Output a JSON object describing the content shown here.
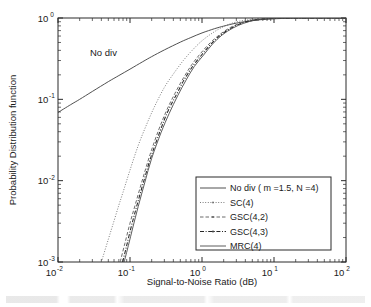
{
  "figure": {
    "title": "",
    "annotation": {
      "text": "No div",
      "x_data": 0.055,
      "y_data": 0.35
    }
  },
  "axes": {
    "x": {
      "label": "Signal-to-Noise Ratio (dB)",
      "scale": "log",
      "min": 0.01,
      "max": 100,
      "tick_labels": [
        "10",
        "10",
        "10",
        "10",
        "10"
      ],
      "tick_exponents": [
        "-2",
        "-1",
        "0",
        "1",
        "2"
      ],
      "tick_values": [
        0.01,
        0.1,
        1,
        10,
        100
      ]
    },
    "y": {
      "label": "Probability Distribution function",
      "scale": "log",
      "min": 0.001,
      "max": 1,
      "tick_labels": [
        "10",
        "10",
        "10",
        "10"
      ],
      "tick_exponents": [
        "0",
        "-1",
        "-2",
        "-3"
      ],
      "tick_values": [
        1,
        0.1,
        0.01,
        0.001
      ]
    }
  },
  "legend": {
    "position": "lower-right",
    "entries": [
      {
        "label": "No div ( m =1.5, N =4)",
        "style": "solid",
        "color": "#3c3c3c",
        "marker": "none"
      },
      {
        "label": "SC(4)",
        "style": "dotted",
        "color": "#6e6e6e",
        "marker": "dot"
      },
      {
        "label": "GSC(4,2)",
        "style": "dashed",
        "color": "#5a5a5a",
        "marker": "dot"
      },
      {
        "label": "GSC(4,3)",
        "style": "dashdot",
        "color": "#262626",
        "marker": "dot"
      },
      {
        "label": "MRC(4)",
        "style": "solid",
        "color": "#4a4a4a",
        "marker": "none"
      }
    ]
  },
  "chart_data": {
    "type": "line",
    "title": "",
    "xlabel": "Signal-to-Noise Ratio (dB)",
    "ylabel": "Probability Distribution function",
    "xscale": "log",
    "yscale": "log",
    "xlim": [
      0.01,
      100
    ],
    "ylim": [
      0.001,
      1
    ],
    "grid": false,
    "legend_position": "lower-right",
    "annotations": [
      {
        "text": "No div",
        "x": 0.055,
        "y": 0.35
      }
    ],
    "series": [
      {
        "name": "No div ( m =1.5, N =4)",
        "style": "solid",
        "color": "#3c3c3c",
        "x": [
          0.01,
          0.015,
          0.02,
          0.03,
          0.05,
          0.07,
          0.1,
          0.15,
          0.2,
          0.3,
          0.5,
          0.7,
          1.0,
          1.5,
          2.0,
          3.0,
          5.0,
          7.0,
          10.0,
          15.0,
          20.0,
          30.0,
          50.0,
          100.0
        ],
        "y": [
          0.069,
          0.086,
          0.1,
          0.125,
          0.165,
          0.196,
          0.235,
          0.29,
          0.335,
          0.405,
          0.505,
          0.575,
          0.655,
          0.74,
          0.795,
          0.865,
          0.93,
          0.958,
          0.978,
          0.991,
          0.996,
          0.999,
          1.0,
          1.0
        ]
      },
      {
        "name": "SC(4)",
        "style": "dotted",
        "color": "#6e6e6e",
        "x": [
          0.04,
          0.05,
          0.06,
          0.07,
          0.08,
          0.1,
          0.13,
          0.17,
          0.22,
          0.3,
          0.4,
          0.55,
          0.75,
          1.0,
          1.4,
          2.0,
          3.0,
          4.5,
          6.0,
          8.0,
          11.0,
          15.0,
          25.0,
          50.0,
          100.0
        ],
        "y": [
          0.001,
          0.0019,
          0.0032,
          0.005,
          0.0072,
          0.0135,
          0.027,
          0.049,
          0.082,
          0.14,
          0.205,
          0.3,
          0.41,
          0.525,
          0.655,
          0.785,
          0.895,
          0.952,
          0.973,
          0.987,
          0.995,
          0.998,
          1.0,
          1.0,
          1.0
        ]
      },
      {
        "name": "GSC(4,2)",
        "style": "dashed",
        "color": "#5a5a5a",
        "x": [
          0.073,
          0.085,
          0.1,
          0.12,
          0.15,
          0.19,
          0.25,
          0.32,
          0.42,
          0.55,
          0.72,
          0.95,
          1.3,
          1.8,
          2.5,
          3.5,
          5.0,
          7.0,
          9.5,
          13.0,
          20.0,
          35.0,
          100.0
        ],
        "y": [
          0.001,
          0.0017,
          0.003,
          0.0053,
          0.0105,
          0.021,
          0.042,
          0.072,
          0.118,
          0.182,
          0.266,
          0.365,
          0.495,
          0.635,
          0.768,
          0.872,
          0.943,
          0.975,
          0.99,
          0.996,
          0.999,
          1.0,
          1.0
        ]
      },
      {
        "name": "GSC(4,3)",
        "style": "dashdot",
        "color": "#262626",
        "x": [
          0.079,
          0.09,
          0.105,
          0.125,
          0.155,
          0.195,
          0.26,
          0.33,
          0.44,
          0.57,
          0.75,
          1.0,
          1.35,
          1.85,
          2.6,
          3.6,
          5.2,
          7.2,
          10.0,
          14.0,
          21.0,
          40.0,
          100.0
        ],
        "y": [
          0.001,
          0.0016,
          0.0028,
          0.005,
          0.0098,
          0.0195,
          0.04,
          0.069,
          0.114,
          0.176,
          0.258,
          0.356,
          0.485,
          0.625,
          0.76,
          0.866,
          0.94,
          0.973,
          0.989,
          0.996,
          0.999,
          1.0,
          1.0
        ]
      },
      {
        "name": "MRC(4)",
        "style": "solid",
        "color": "#4a4a4a",
        "x": [
          0.083,
          0.095,
          0.11,
          0.13,
          0.16,
          0.2,
          0.27,
          0.35,
          0.46,
          0.6,
          0.78,
          1.05,
          1.4,
          1.9,
          2.7,
          3.8,
          5.4,
          7.5,
          10.5,
          15.0,
          22.0,
          45.0,
          100.0
        ],
        "y": [
          0.001,
          0.0016,
          0.0027,
          0.0048,
          0.0094,
          0.0188,
          0.039,
          0.067,
          0.111,
          0.172,
          0.253,
          0.35,
          0.478,
          0.618,
          0.755,
          0.862,
          0.938,
          0.972,
          0.988,
          0.9955,
          0.999,
          1.0,
          1.0
        ]
      }
    ]
  }
}
